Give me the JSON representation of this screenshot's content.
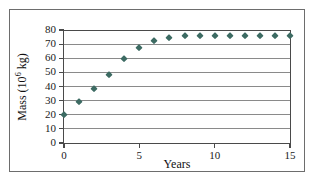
{
  "chart_data": {
    "type": "scatter",
    "title": "",
    "xlabel": "Years",
    "ylabel_text": "Mass (10",
    "ylabel_exponent": "6",
    "ylabel_tail": " kg)",
    "ylabel_full": "Mass (10^6 kg)",
    "x": [
      0,
      1,
      2,
      3,
      4,
      5,
      6,
      7,
      8,
      9,
      10,
      11,
      12,
      13,
      14,
      15
    ],
    "values": [
      20,
      29,
      38,
      48,
      59.5,
      67,
      72,
      74.5,
      75.5,
      76,
      76,
      76,
      76,
      76,
      76,
      76
    ],
    "xlim": [
      0,
      15
    ],
    "ylim": [
      0,
      80
    ],
    "xticks": [
      0,
      5,
      10,
      15
    ],
    "xtick_labels": [
      "0",
      "5",
      "10",
      "15"
    ],
    "yticks": [
      0,
      10,
      20,
      30,
      40,
      50,
      60,
      70,
      80
    ],
    "ytick_labels": [
      "0",
      "10",
      "20",
      "30",
      "40",
      "50",
      "60",
      "70",
      "80"
    ],
    "grid": "horizontal",
    "legend": "none",
    "marker_shape": "diamond",
    "marker_color": "#3d6b63",
    "grid_color": "#8a8a8a",
    "axis_color": "#4a4a4a",
    "frame_color": "#6d6d6d",
    "background_color": "#ffffff"
  }
}
